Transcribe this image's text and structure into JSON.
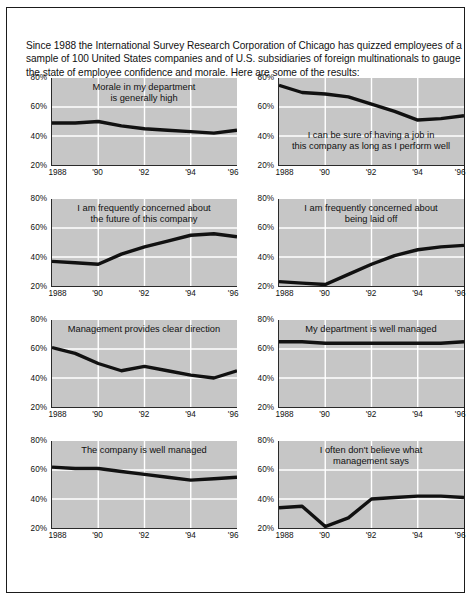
{
  "intro": {
    "text": "Since 1988 the International Survey Research Corporation of Chicago has quizzed employees of a sample of 100 United States companies and of U.S. subsidiaries of foreign multinationals to gauge the state of employee confidence and morale. Here are some of the results:"
  },
  "colors": {
    "plot_background": "#c6c6c6",
    "gridline": "#ffffff",
    "axis": "#2a2a2a",
    "series_line": "#111111",
    "page_background": "#ffffff",
    "border": "#1b1b1b"
  },
  "axis": {
    "y_ticks": [
      "20%",
      "40%",
      "60%",
      "80%"
    ],
    "y_values": [
      20,
      40,
      60,
      80
    ],
    "ylim": [
      20,
      80
    ],
    "x_ticks": [
      "1988",
      "'90",
      "'92",
      "'94",
      "'96"
    ],
    "x_tick_years": [
      1988,
      1990,
      1992,
      1994,
      1996
    ],
    "xlim": [
      1988,
      1996
    ]
  },
  "chart_data": [
    {
      "type": "line",
      "title": "Morale in my department is generally high",
      "title_lines": [
        "Morale in my department",
        "is generally high"
      ],
      "title_position": "top",
      "xlabel": "",
      "ylabel": "",
      "ylim": [
        20,
        80
      ],
      "xlim": [
        1988,
        1996
      ],
      "grid": true,
      "legend": "none",
      "x": [
        1988,
        1989,
        1990,
        1991,
        1992,
        1993,
        1994,
        1995,
        1996
      ],
      "xticklabels": [
        "1988",
        "'90",
        "'92",
        "'94",
        "'96"
      ],
      "yticklabels": [
        "20%",
        "40%",
        "60%",
        "80%"
      ],
      "values": [
        49,
        49,
        50,
        47,
        45,
        44,
        43,
        42,
        44
      ]
    },
    {
      "type": "line",
      "title": "I can be sure of having a job in this company as long as I perform well",
      "title_lines": [
        "I can be sure of having a job in",
        "this company as long as I perform well"
      ],
      "title_position": "low",
      "xlabel": "",
      "ylabel": "",
      "ylim": [
        20,
        80
      ],
      "xlim": [
        1988,
        1996
      ],
      "grid": true,
      "legend": "none",
      "x": [
        1988,
        1989,
        1990,
        1991,
        1992,
        1993,
        1994,
        1995,
        1996
      ],
      "xticklabels": [
        "1988",
        "'90",
        "'92",
        "'94",
        "'96"
      ],
      "yticklabels": [
        "20%",
        "40%",
        "60%",
        "80%"
      ],
      "values": [
        75,
        70,
        69,
        67,
        62,
        57,
        51,
        52,
        54
      ]
    },
    {
      "type": "line",
      "title": "I am frequently concerned about the future of this company",
      "title_lines": [
        "I am frequently concerned about",
        "the future of this company"
      ],
      "title_position": "top",
      "xlabel": "",
      "ylabel": "",
      "ylim": [
        20,
        80
      ],
      "xlim": [
        1988,
        1996
      ],
      "grid": true,
      "legend": "none",
      "x": [
        1988,
        1989,
        1990,
        1991,
        1992,
        1993,
        1994,
        1995,
        1996
      ],
      "xticklabels": [
        "1988",
        "'90",
        "'92",
        "'94",
        "'96"
      ],
      "yticklabels": [
        "20%",
        "40%",
        "60%",
        "80%"
      ],
      "values": [
        37,
        36,
        35,
        42,
        47,
        51,
        55,
        56,
        54
      ]
    },
    {
      "type": "line",
      "title": "I am frequently concerned about being laid off",
      "title_lines": [
        "I am frequently concerned about",
        "being laid off"
      ],
      "title_position": "top",
      "xlabel": "",
      "ylabel": "",
      "ylim": [
        20,
        80
      ],
      "xlim": [
        1988,
        1996
      ],
      "grid": true,
      "legend": "none",
      "x": [
        1988,
        1989,
        1990,
        1991,
        1992,
        1993,
        1994,
        1995,
        1996
      ],
      "xticklabels": [
        "1988",
        "'90",
        "'92",
        "'94",
        "'96"
      ],
      "yticklabels": [
        "20%",
        "40%",
        "60%",
        "80%"
      ],
      "values": [
        23,
        22,
        21,
        28,
        35,
        41,
        45,
        47,
        48
      ]
    },
    {
      "type": "line",
      "title": "Management provides clear direction",
      "title_lines": [
        "Management provides clear direction"
      ],
      "title_position": "top",
      "xlabel": "",
      "ylabel": "",
      "ylim": [
        20,
        80
      ],
      "xlim": [
        1988,
        1996
      ],
      "grid": true,
      "legend": "none",
      "x": [
        1988,
        1989,
        1990,
        1991,
        1992,
        1993,
        1994,
        1995,
        1996
      ],
      "xticklabels": [
        "1988",
        "'90",
        "'92",
        "'94",
        "'96"
      ],
      "yticklabels": [
        "20%",
        "40%",
        "60%",
        "80%"
      ],
      "values": [
        61,
        57,
        50,
        45,
        48,
        45,
        42,
        40,
        45
      ]
    },
    {
      "type": "line",
      "title": "My department is well managed",
      "title_lines": [
        "My department is well managed"
      ],
      "title_position": "top",
      "xlabel": "",
      "ylabel": "",
      "ylim": [
        20,
        80
      ],
      "xlim": [
        1988,
        1996
      ],
      "grid": true,
      "legend": "none",
      "x": [
        1988,
        1989,
        1990,
        1991,
        1992,
        1993,
        1994,
        1995,
        1996
      ],
      "xticklabels": [
        "1988",
        "'90",
        "'92",
        "'94",
        "'96"
      ],
      "yticklabels": [
        "20%",
        "40%",
        "60%",
        "80%"
      ],
      "values": [
        65,
        65,
        64,
        64,
        64,
        64,
        64,
        64,
        65
      ]
    },
    {
      "type": "line",
      "title": "The company is well managed",
      "title_lines": [
        "The company is well managed"
      ],
      "title_position": "top",
      "xlabel": "",
      "ylabel": "",
      "ylim": [
        20,
        80
      ],
      "xlim": [
        1988,
        1996
      ],
      "grid": true,
      "legend": "none",
      "x": [
        1988,
        1989,
        1990,
        1991,
        1992,
        1993,
        1994,
        1995,
        1996
      ],
      "xticklabels": [
        "1988",
        "'90",
        "'92",
        "'94",
        "'96"
      ],
      "yticklabels": [
        "20%",
        "40%",
        "60%",
        "80%"
      ],
      "values": [
        62,
        61,
        61,
        59,
        57,
        55,
        53,
        54,
        55
      ]
    },
    {
      "type": "line",
      "title": "I often don't believe what management says",
      "title_lines": [
        "I often don't believe what",
        "management says"
      ],
      "title_position": "top",
      "xlabel": "",
      "ylabel": "",
      "ylim": [
        20,
        80
      ],
      "xlim": [
        1988,
        1996
      ],
      "grid": true,
      "legend": "none",
      "x": [
        1988,
        1989,
        1990,
        1991,
        1992,
        1993,
        1994,
        1995,
        1996
      ],
      "xticklabels": [
        "1988",
        "'90",
        "'92",
        "'94",
        "'96"
      ],
      "yticklabels": [
        "20%",
        "40%",
        "60%",
        "80%"
      ],
      "values": [
        34,
        35,
        21,
        27,
        40,
        41,
        42,
        42,
        41
      ]
    }
  ]
}
